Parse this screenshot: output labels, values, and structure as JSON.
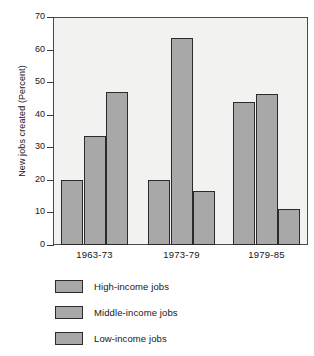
{
  "chart_data": {
    "type": "bar",
    "title": "",
    "xlabel": "",
    "ylabel": "New jobs created (Percent)",
    "categories": [
      "1963-73",
      "1973-79",
      "1979-85"
    ],
    "series": [
      {
        "name": "High-income jobs",
        "values": [
          20,
          20,
          44
        ]
      },
      {
        "name": "Middle-income jobs",
        "values": [
          33.5,
          63.5,
          46.5
        ]
      },
      {
        "name": "Low-income jobs",
        "values": [
          47,
          16.5,
          11
        ]
      }
    ],
    "ylim": [
      0,
      70
    ],
    "ytick_labels": [
      "0",
      "10",
      "20",
      "30",
      "40",
      "50",
      "60",
      "70"
    ],
    "ytick_values": [
      0,
      10,
      20,
      30,
      40,
      50,
      60,
      70
    ],
    "grid": false,
    "legend_position": "below",
    "colors": {
      "bar_fill": "#a8a8a8",
      "bar_edge": "#2b2b2b",
      "plot_background": "#f2f2f0",
      "axis": "#4a4a4a",
      "text": "#161616"
    }
  }
}
